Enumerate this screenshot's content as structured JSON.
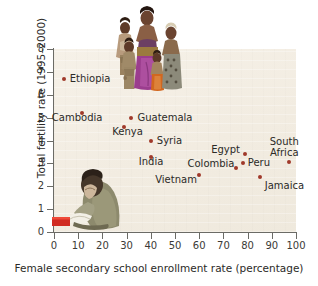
{
  "chart_data": {
    "type": "scatter",
    "title": "",
    "xlabel": "Female secondary school enrollment rate (percentage)",
    "ylabel": "Total fertility rate (1995–2000)",
    "xlim": [
      0,
      100
    ],
    "ylim": [
      0,
      8
    ],
    "xticks": [
      "0",
      "10",
      "20",
      "30",
      "40",
      "50",
      "60",
      "70",
      "80",
      "90",
      "100"
    ],
    "yticks": [
      "0",
      "1",
      "2",
      "3",
      "4",
      "5",
      "6",
      "7",
      "8"
    ],
    "grid": false,
    "legend": "none",
    "points": [
      {
        "label": "Ethiopia",
        "x": 4,
        "y": 6.7,
        "label_dx": 6,
        "label_dy": -5
      },
      {
        "label": "Cambodia",
        "x": 11.5,
        "y": 5.2,
        "label_dx": -30,
        "label_dy": 4
      },
      {
        "label": "Guatemala",
        "x": 32,
        "y": 5.0,
        "label_dx": 6,
        "label_dy": -5
      },
      {
        "label": "Kenya",
        "x": 29,
        "y": 4.6,
        "label_dx": -12,
        "label_dy": 4
      },
      {
        "label": "Syria",
        "x": 40,
        "y": 4.0,
        "label_dx": 6,
        "label_dy": -5
      },
      {
        "label": "India",
        "x": 40,
        "y": 3.3,
        "label_dx": -12,
        "label_dy": 4
      },
      {
        "label": "Egypt",
        "x": 79,
        "y": 3.4,
        "label_dx": -34,
        "label_dy": -5
      },
      {
        "label": "South Africa",
        "x": 97,
        "y": 3.05,
        "label_dx": -3,
        "label_dy": -26
      },
      {
        "label": "Peru",
        "x": 78,
        "y": 3.0,
        "label_dx": 5,
        "label_dy": -5
      },
      {
        "label": "Colombia",
        "x": 75,
        "y": 2.8,
        "label_dx": -48,
        "label_dy": -5
      },
      {
        "label": "Vietnam",
        "x": 60,
        "y": 2.5,
        "label_dx": -44,
        "label_dy": 4
      },
      {
        "label": "Jamaica",
        "x": 85,
        "y": 2.4,
        "label_dx": 5,
        "label_dy": 4
      }
    ],
    "colors": {
      "point": "#a0392a",
      "plot_background": "#f4efe5",
      "axis": "#6b6b66",
      "text": "#2b2a27"
    }
  },
  "illustrations": {
    "family": "african-family-photo",
    "reader": "person-reading-book-photo"
  }
}
